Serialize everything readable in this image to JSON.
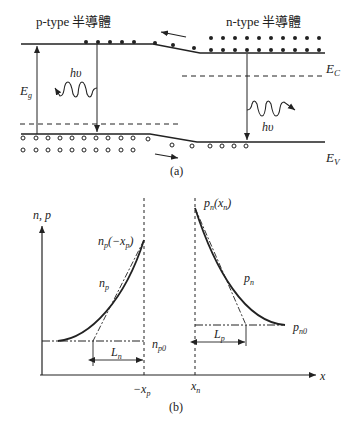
{
  "figure_a": {
    "p_label": "p-type 半導體",
    "n_label": "n-type 半導體",
    "ec_label": "E",
    "ec_sub": "C",
    "ev_label": "E",
    "ev_sub": "V",
    "eg_label": "E",
    "eg_sub": "g",
    "photon_left": "hυ",
    "photon_right": "hυ",
    "caption": "(a)"
  },
  "figure_b": {
    "y_axis_label": "n, p",
    "x_axis_label": "x",
    "np_edge_label": "n",
    "np_edge_sub": "p",
    "np_edge_arg": "(−x",
    "np_edge_arg_sub": "p",
    "np_edge_close": ")",
    "pn_edge_label": "p",
    "pn_edge_sub": "n",
    "pn_edge_arg": "(x",
    "pn_edge_arg_sub": "n",
    "pn_edge_close": ")",
    "np_curve_label": "n",
    "np_curve_sub": "p",
    "pn_curve_label": "p",
    "pn_curve_sub": "n",
    "np0_label": "n",
    "np0_sub": "p0",
    "pn0_label": "p",
    "pn0_sub": "n0",
    "ln_label": "L",
    "ln_sub": "n",
    "lp_label": "L",
    "lp_sub": "p",
    "neg_xp_label": "−x",
    "neg_xp_sub": "p",
    "xn_label": "x",
    "xn_sub": "n",
    "caption": "(b)"
  }
}
